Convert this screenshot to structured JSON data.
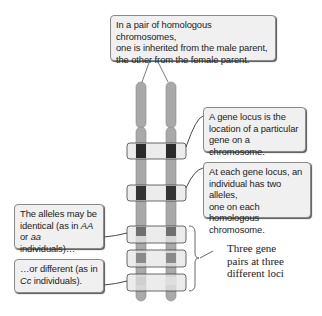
{
  "diagram": {
    "title_callout": {
      "lines": [
        "In a pair of homologous chromosomes,",
        "one is inherited from the male parent,",
        "the other from the female parent."
      ]
    },
    "locus_callout": {
      "lines": [
        "A gene locus is the",
        "location of a particular",
        "gene on a chromosome."
      ]
    },
    "alleles_callout": {
      "lines": [
        "At each gene locus, an",
        "individual has two alleles,",
        "one on each homologous",
        "chromosome."
      ]
    },
    "identical_callout": {
      "line1": "The alleles may be",
      "line2_pre": "identical (as in ",
      "line2_em": "AA",
      "line3_pre": "or ",
      "line3_em": "aa",
      "line3_post": " individuals)…"
    },
    "different_callout": {
      "line1": "…or different (as in",
      "line2_em": "Cc",
      "line2_post": " individuals)."
    },
    "brace_label": {
      "lines": [
        "Three gene",
        "pairs at three",
        "different loci"
      ]
    },
    "colors": {
      "chromosome": "#a9a9a9",
      "locus_band": "#e6e6e6",
      "allele_dark": "#2b2b2b",
      "allele_medium": "#6f6f6f",
      "allele_light": "#cfcfcf",
      "callout_bg": "#f0f0f0"
    },
    "chromosomes": [
      {
        "name": "maternal-chromosome",
        "x": 136,
        "width": 10
      },
      {
        "name": "paternal-chromosome",
        "x": 165,
        "width": 10
      }
    ],
    "loci": [
      {
        "name": "locus-1",
        "y": 143,
        "alleles": [
          "dark",
          "dark"
        ]
      },
      {
        "name": "locus-2",
        "y": 185,
        "alleles": [
          "dark",
          "dark"
        ]
      },
      {
        "name": "locus-3-AA",
        "y": 226,
        "alleles": [
          "medium",
          "medium"
        ]
      },
      {
        "name": "locus-4",
        "y": 250,
        "alleles": [
          "medium",
          "medium"
        ]
      },
      {
        "name": "locus-5-Cc",
        "y": 274,
        "alleles": [
          "light",
          "light"
        ]
      }
    ]
  }
}
